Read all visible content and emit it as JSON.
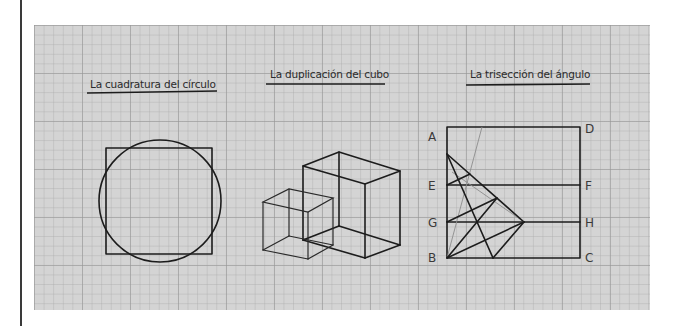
{
  "figure": {
    "background": "#d4d4d4",
    "ink_color": "#1c1c1c",
    "panels": [
      {
        "id": "circle",
        "title": "La cuadratura del círculo",
        "shapes": [
          "square",
          "circle"
        ]
      },
      {
        "id": "cube",
        "title": "La duplicación del cubo",
        "shapes": [
          "small-cube",
          "large-cube"
        ]
      },
      {
        "id": "angle",
        "title": "La trisección del ángulo",
        "points": {
          "A": "A",
          "D": "D",
          "E": "E",
          "F": "F",
          "G": "G",
          "H": "H",
          "B": "B",
          "C": "C"
        }
      }
    ]
  }
}
